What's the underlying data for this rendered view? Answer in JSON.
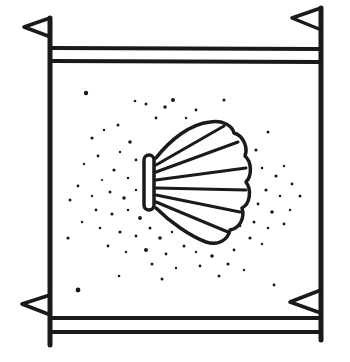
{
  "image": {
    "description": "Line drawing of a square banner with small flags at the four corners and a scallop shell surrounded by stippled dots in the center",
    "colors": {
      "ink": "#1a1a1a",
      "background": "#ffffff"
    },
    "elements": {
      "frame": "square-banner",
      "corner_flags": [
        "top-left",
        "top-right",
        "bottom-left",
        "bottom-right"
      ],
      "center_motif": "scallop-shell",
      "texture": "stipple-dots"
    }
  }
}
